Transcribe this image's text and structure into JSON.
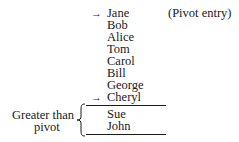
{
  "diagram": {
    "entries": [
      {
        "name": "Jane",
        "marked": true
      },
      {
        "name": "Bob",
        "marked": false
      },
      {
        "name": "Alice",
        "marked": false
      },
      {
        "name": "Tom",
        "marked": false
      },
      {
        "name": "Carol",
        "marked": false
      },
      {
        "name": "Bill",
        "marked": false
      },
      {
        "name": "George",
        "marked": false
      },
      {
        "name": "Cheryl",
        "marked": true
      },
      {
        "name": "Sue",
        "marked": false
      },
      {
        "name": "John",
        "marked": false
      }
    ],
    "arrow_glyph": "→",
    "pivot_note": "(Pivot entry)",
    "group_label_line1": "Greater than",
    "group_label_line2": "pivot"
  }
}
